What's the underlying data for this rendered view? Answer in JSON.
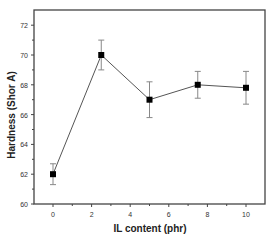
{
  "chart_data": {
    "type": "line",
    "title": "",
    "xlabel": "IL content (phr)",
    "ylabel": "Hardness (Shor A)",
    "xlim": [
      -1.2,
      10.9
    ],
    "ylim": [
      60,
      73
    ],
    "x_ticks": [
      0,
      2,
      4,
      6,
      8,
      10
    ],
    "y_ticks": [
      60,
      62,
      64,
      66,
      68,
      70,
      72
    ],
    "grid": false,
    "legend": null,
    "series": [
      {
        "name": "Hardness",
        "marker": "square",
        "color": "#000000",
        "line_color": "#555555",
        "x": [
          0,
          2.5,
          5,
          7.5,
          10
        ],
        "values": [
          62.0,
          70.0,
          67.0,
          68.0,
          67.8
        ],
        "error": [
          0.7,
          1.0,
          1.2,
          0.9,
          1.1
        ]
      }
    ]
  }
}
